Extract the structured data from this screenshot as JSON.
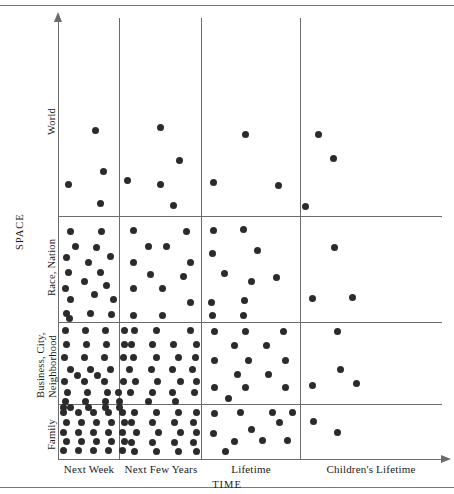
{
  "chart_data": {
    "type": "scatter",
    "title": "",
    "xlabel": "TIME",
    "ylabel": "SPACE",
    "grid": true,
    "legend": "none",
    "categories_x": [
      "Next Week",
      "Next Few Years",
      "Lifetime",
      "Children's Lifetime"
    ],
    "categories_y": [
      "Family",
      "Business, City, Neighborhood",
      "Race, Nation",
      "World"
    ],
    "encoding": "dot-density; each dot represents one unit of concern. Density decreases toward longer time horizons and larger spatial scales.",
    "cells": [
      {
        "y": "World",
        "x": "Next Week",
        "count": 4
      },
      {
        "y": "World",
        "x": "Next Few Years",
        "count": 5
      },
      {
        "y": "World",
        "x": "Lifetime",
        "count": 3
      },
      {
        "y": "World",
        "x": "Children's Lifetime",
        "count": 3
      },
      {
        "y": "Race, Nation",
        "x": "Next Week",
        "count": 19
      },
      {
        "y": "Race, Nation",
        "x": "Next Few Years",
        "count": 12
      },
      {
        "y": "Race, Nation",
        "x": "Lifetime",
        "count": 12
      },
      {
        "y": "Race, Nation",
        "x": "Children's Lifetime",
        "count": 3
      },
      {
        "y": "Business, City, Neighborhood",
        "x": "Next Week",
        "count": 29
      },
      {
        "y": "Business, City, Neighborhood",
        "x": "Next Few Years",
        "count": 25
      },
      {
        "y": "Business, City, Neighborhood",
        "x": "Lifetime",
        "count": 14
      },
      {
        "y": "Business, City, Neighborhood",
        "x": "Children's Lifetime",
        "count": 4
      },
      {
        "y": "Family",
        "x": "Next Week",
        "count": 30
      },
      {
        "y": "Family",
        "x": "Next Few Years",
        "count": 20
      },
      {
        "y": "Family",
        "x": "Lifetime",
        "count": 11
      },
      {
        "y": "Family",
        "x": "Children's Lifetime",
        "count": 2
      }
    ],
    "points": [
      [
        68,
        184
      ],
      [
        95,
        130
      ],
      [
        103,
        171
      ],
      [
        100,
        203
      ],
      [
        127,
        180
      ],
      [
        160,
        127
      ],
      [
        179,
        160
      ],
      [
        160,
        184
      ],
      [
        173,
        205
      ],
      [
        213,
        182
      ],
      [
        245,
        134
      ],
      [
        278,
        185
      ],
      [
        318,
        134
      ],
      [
        305,
        206
      ],
      [
        333,
        158
      ],
      [
        70,
        231
      ],
      [
        101,
        231
      ],
      [
        75,
        246
      ],
      [
        96,
        247
      ],
      [
        66,
        257
      ],
      [
        88,
        262
      ],
      [
        110,
        256
      ],
      [
        68,
        272
      ],
      [
        100,
        272
      ],
      [
        65,
        288
      ],
      [
        84,
        281
      ],
      [
        106,
        285
      ],
      [
        70,
        299
      ],
      [
        94,
        294
      ],
      [
        113,
        299
      ],
      [
        66,
        313
      ],
      [
        90,
        313
      ],
      [
        111,
        314
      ],
      [
        69,
        318
      ],
      [
        133,
        230
      ],
      [
        186,
        231
      ],
      [
        148,
        246
      ],
      [
        166,
        246
      ],
      [
        133,
        262
      ],
      [
        190,
        262
      ],
      [
        150,
        274
      ],
      [
        183,
        276
      ],
      [
        133,
        288
      ],
      [
        162,
        288
      ],
      [
        190,
        302
      ],
      [
        133,
        315
      ],
      [
        162,
        315
      ],
      [
        213,
        230
      ],
      [
        243,
        229
      ],
      [
        212,
        253
      ],
      [
        257,
        250
      ],
      [
        224,
        273
      ],
      [
        251,
        281
      ],
      [
        276,
        277
      ],
      [
        211,
        302
      ],
      [
        244,
        300
      ],
      [
        212,
        315
      ],
      [
        243,
        315
      ],
      [
        334,
        247
      ],
      [
        312,
        298
      ],
      [
        352,
        297
      ],
      [
        65,
        330
      ],
      [
        85,
        330
      ],
      [
        105,
        330
      ],
      [
        124,
        330
      ],
      [
        66,
        344
      ],
      [
        86,
        344
      ],
      [
        106,
        344
      ],
      [
        124,
        344
      ],
      [
        64,
        357
      ],
      [
        84,
        357
      ],
      [
        104,
        357
      ],
      [
        123,
        357
      ],
      [
        70,
        369
      ],
      [
        90,
        369
      ],
      [
        110,
        369
      ],
      [
        64,
        381
      ],
      [
        84,
        381
      ],
      [
        104,
        381
      ],
      [
        123,
        381
      ],
      [
        67,
        392
      ],
      [
        87,
        392
      ],
      [
        107,
        392
      ],
      [
        118,
        392
      ],
      [
        65,
        401
      ],
      [
        85,
        401
      ],
      [
        105,
        401
      ],
      [
        119,
        401
      ],
      [
        77,
        375
      ],
      [
        97,
        375
      ],
      [
        134,
        330
      ],
      [
        156,
        330
      ],
      [
        190,
        330
      ],
      [
        131,
        344
      ],
      [
        152,
        344
      ],
      [
        173,
        344
      ],
      [
        196,
        344
      ],
      [
        133,
        357
      ],
      [
        156,
        357
      ],
      [
        178,
        357
      ],
      [
        195,
        357
      ],
      [
        129,
        369
      ],
      [
        151,
        369
      ],
      [
        172,
        369
      ],
      [
        192,
        369
      ],
      [
        135,
        381
      ],
      [
        157,
        381
      ],
      [
        180,
        381
      ],
      [
        196,
        381
      ],
      [
        130,
        392
      ],
      [
        152,
        392
      ],
      [
        172,
        392
      ],
      [
        194,
        392
      ],
      [
        148,
        401
      ],
      [
        175,
        401
      ],
      [
        214,
        331
      ],
      [
        245,
        331
      ],
      [
        283,
        331
      ],
      [
        234,
        345
      ],
      [
        266,
        345
      ],
      [
        214,
        360
      ],
      [
        248,
        360
      ],
      [
        285,
        360
      ],
      [
        237,
        374
      ],
      [
        268,
        374
      ],
      [
        214,
        387
      ],
      [
        245,
        387
      ],
      [
        285,
        387
      ],
      [
        228,
        398
      ],
      [
        337,
        331
      ],
      [
        340,
        369
      ],
      [
        312,
        385
      ],
      [
        356,
        383
      ],
      [
        63,
        412
      ],
      [
        78,
        412
      ],
      [
        93,
        412
      ],
      [
        108,
        412
      ],
      [
        122,
        412
      ],
      [
        66,
        422
      ],
      [
        81,
        422
      ],
      [
        96,
        422
      ],
      [
        111,
        422
      ],
      [
        124,
        422
      ],
      [
        63,
        432
      ],
      [
        78,
        432
      ],
      [
        93,
        432
      ],
      [
        108,
        432
      ],
      [
        122,
        432
      ],
      [
        66,
        441
      ],
      [
        81,
        441
      ],
      [
        96,
        441
      ],
      [
        111,
        441
      ],
      [
        124,
        441
      ],
      [
        63,
        450
      ],
      [
        78,
        450
      ],
      [
        93,
        450
      ],
      [
        108,
        450
      ],
      [
        122,
        450
      ],
      [
        70,
        407
      ],
      [
        88,
        407
      ],
      [
        105,
        407
      ],
      [
        119,
        407
      ],
      [
        63,
        407
      ],
      [
        134,
        412
      ],
      [
        156,
        412
      ],
      [
        178,
        412
      ],
      [
        196,
        412
      ],
      [
        131,
        422
      ],
      [
        152,
        422
      ],
      [
        174,
        422
      ],
      [
        193,
        422
      ],
      [
        136,
        432
      ],
      [
        158,
        432
      ],
      [
        180,
        432
      ],
      [
        196,
        432
      ],
      [
        131,
        442
      ],
      [
        152,
        442
      ],
      [
        174,
        442
      ],
      [
        193,
        442
      ],
      [
        134,
        451
      ],
      [
        156,
        451
      ],
      [
        178,
        451
      ],
      [
        196,
        451
      ],
      [
        214,
        413
      ],
      [
        240,
        412
      ],
      [
        272,
        412
      ],
      [
        292,
        412
      ],
      [
        279,
        422
      ],
      [
        213,
        433
      ],
      [
        234,
        441
      ],
      [
        251,
        429
      ],
      [
        262,
        440
      ],
      [
        287,
        440
      ],
      [
        225,
        451
      ],
      [
        313,
        421
      ],
      [
        337,
        432
      ]
    ]
  },
  "axes": {
    "x_title": "TIME",
    "y_title": "SPACE",
    "x_ticks": [
      {
        "label": "Next Week",
        "center": 89
      },
      {
        "label": "Next Few Years",
        "center": 161
      },
      {
        "label": "Lifetime",
        "center": 251
      },
      {
        "label": "Children's Lifetime",
        "center": 371
      }
    ],
    "y_ticks": [
      {
        "label": "World"
      },
      {
        "label": "Race, Nation"
      },
      {
        "label": "Business, City,"
      },
      {
        "label": "Neighborhood"
      },
      {
        "label": "Family"
      }
    ]
  }
}
